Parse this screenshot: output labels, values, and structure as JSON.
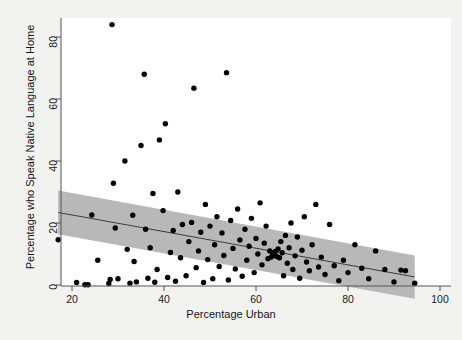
{
  "chart_data": {
    "type": "scatter",
    "title": "",
    "xlabel": "Percentage Urban",
    "ylabel": "Percentage who Speak Native Language at Home",
    "xlim": [
      14,
      97
    ],
    "ylim": [
      -4,
      88
    ],
    "xticks": [
      20,
      40,
      60,
      80,
      100
    ],
    "yticks": [
      0,
      20,
      40,
      60,
      80
    ],
    "grid": false,
    "point_color": "#000000",
    "line_color": "#3c3c3c",
    "band_color": "#b4b4b4",
    "fit_line": {
      "x": [
        17.0,
        94.5
      ],
      "y": [
        23.4,
        2.6
      ]
    },
    "confidence_band": {
      "x": [
        17.0,
        94.5
      ],
      "upper": [
        30.5,
        9.5
      ],
      "lower": [
        16.4,
        -4.4
      ]
    },
    "points": [
      [
        17.0,
        14.6
      ],
      [
        21.0,
        0.8
      ],
      [
        22.8,
        0.1
      ],
      [
        23.5,
        0.1
      ],
      [
        24.3,
        22.6
      ],
      [
        25.6,
        8.0
      ],
      [
        28.0,
        0.5
      ],
      [
        28.3,
        1.8
      ],
      [
        28.7,
        84.0
      ],
      [
        29.0,
        32.8
      ],
      [
        29.4,
        18.4
      ],
      [
        30.0,
        2.0
      ],
      [
        31.5,
        40.0
      ],
      [
        32.0,
        11.5
      ],
      [
        32.6,
        0.6
      ],
      [
        33.2,
        22.5
      ],
      [
        33.5,
        7.6
      ],
      [
        34.0,
        1.0
      ],
      [
        35.0,
        45.0
      ],
      [
        35.7,
        68.0
      ],
      [
        36.0,
        18.0
      ],
      [
        36.5,
        2.2
      ],
      [
        37.0,
        12.0
      ],
      [
        37.6,
        29.5
      ],
      [
        38.0,
        0.9
      ],
      [
        38.5,
        5.0
      ],
      [
        39.0,
        46.8
      ],
      [
        39.8,
        24.0
      ],
      [
        40.3,
        52.0
      ],
      [
        40.8,
        2.4
      ],
      [
        41.4,
        10.5
      ],
      [
        42.0,
        17.6
      ],
      [
        42.5,
        1.2
      ],
      [
        43.0,
        30.0
      ],
      [
        43.6,
        8.8
      ],
      [
        44.0,
        19.5
      ],
      [
        44.8,
        3.0
      ],
      [
        45.4,
        14.0
      ],
      [
        46.0,
        20.2
      ],
      [
        46.5,
        63.5
      ],
      [
        47.0,
        5.6
      ],
      [
        47.5,
        11.0
      ],
      [
        48.0,
        17.0
      ],
      [
        48.6,
        0.8
      ],
      [
        49.0,
        26.0
      ],
      [
        49.5,
        8.2
      ],
      [
        50.0,
        19.0
      ],
      [
        50.6,
        2.0
      ],
      [
        51.0,
        13.0
      ],
      [
        51.5,
        22.0
      ],
      [
        52.0,
        6.0
      ],
      [
        52.6,
        16.8
      ],
      [
        53.0,
        9.5
      ],
      [
        53.6,
        68.5
      ],
      [
        54.0,
        1.6
      ],
      [
        54.5,
        20.8
      ],
      [
        55.0,
        11.8
      ],
      [
        55.5,
        5.2
      ],
      [
        56.0,
        24.5
      ],
      [
        56.5,
        14.5
      ],
      [
        57.0,
        2.8
      ],
      [
        57.6,
        18.0
      ],
      [
        58.0,
        8.0
      ],
      [
        58.5,
        12.5
      ],
      [
        59.0,
        21.5
      ],
      [
        59.6,
        4.0
      ],
      [
        60.0,
        15.0
      ],
      [
        60.4,
        10.0
      ],
      [
        60.9,
        26.5
      ],
      [
        61.3,
        6.5
      ],
      [
        61.8,
        13.5
      ],
      [
        62.2,
        19.0
      ],
      [
        62.6,
        8.5
      ],
      [
        63.0,
        11.0
      ],
      [
        63.3,
        9.0
      ],
      [
        63.6,
        10.2
      ],
      [
        63.9,
        9.6
      ],
      [
        64.2,
        10.8
      ],
      [
        64.5,
        9.2
      ],
      [
        64.8,
        11.6
      ],
      [
        65.1,
        8.8
      ],
      [
        65.4,
        14.0
      ],
      [
        65.7,
        10.4
      ],
      [
        66.0,
        3.0
      ],
      [
        66.4,
        16.0
      ],
      [
        66.8,
        7.0
      ],
      [
        67.2,
        12.0
      ],
      [
        67.6,
        20.0
      ],
      [
        68.0,
        5.0
      ],
      [
        68.5,
        9.4
      ],
      [
        69.0,
        15.5
      ],
      [
        69.5,
        2.2
      ],
      [
        70.0,
        11.2
      ],
      [
        70.5,
        22.0
      ],
      [
        71.0,
        7.4
      ],
      [
        71.6,
        4.6
      ],
      [
        72.2,
        13.0
      ],
      [
        73.0,
        26.0
      ],
      [
        73.6,
        5.8
      ],
      [
        74.2,
        9.0
      ],
      [
        75.0,
        3.4
      ],
      [
        76.0,
        19.5
      ],
      [
        77.0,
        6.2
      ],
      [
        78.0,
        1.4
      ],
      [
        79.0,
        8.0
      ],
      [
        80.0,
        4.0
      ],
      [
        81.5,
        13.0
      ],
      [
        83.0,
        5.4
      ],
      [
        84.5,
        2.0
      ],
      [
        86.0,
        11.0
      ],
      [
        88.0,
        5.0
      ],
      [
        90.0,
        1.0
      ],
      [
        91.5,
        4.8
      ],
      [
        92.5,
        4.6
      ],
      [
        94.5,
        0.6
      ]
    ]
  }
}
